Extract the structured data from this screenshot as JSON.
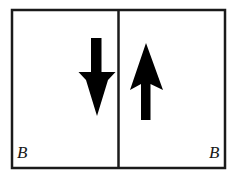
{
  "figure": {
    "background_color": "#ffffff",
    "stroke_color": "#1a1a1a",
    "fill_color": "#000000",
    "frame": {
      "x": 12,
      "y": 10,
      "width": 213,
      "height": 158,
      "border_width": 2.5
    },
    "divider": {
      "x": 118.5,
      "y_top": 10,
      "y_bottom": 168,
      "width": 2.5
    },
    "panels": [
      {
        "id": "left-panel",
        "label": "B",
        "label_position": "bottom-left",
        "field_direction": "down",
        "arrow": {
          "name": "down-arrow",
          "direction": "down",
          "shaft_x_min": 91,
          "shaft_x_max": 101.5,
          "shaft_y_top": 38,
          "head_y_top": 72,
          "head_x_min": 78.5,
          "head_x_max": 115.5,
          "barb_notch_y": 79,
          "tip_x": 97,
          "tip_y": 116
        }
      },
      {
        "id": "right-panel",
        "label": "B",
        "label_position": "bottom-right",
        "field_direction": "up",
        "arrow": {
          "name": "up-arrow",
          "direction": "up",
          "shaft_x_min": 141,
          "shaft_x_max": 150.5,
          "shaft_y_bottom": 120,
          "head_y_bottom": 90,
          "head_x_min": 130,
          "head_x_max": 163,
          "barb_notch_y": 83,
          "tip_x": 146,
          "tip_y": 43
        }
      }
    ]
  },
  "labels": {
    "left_field": "B",
    "right_field": "B"
  }
}
